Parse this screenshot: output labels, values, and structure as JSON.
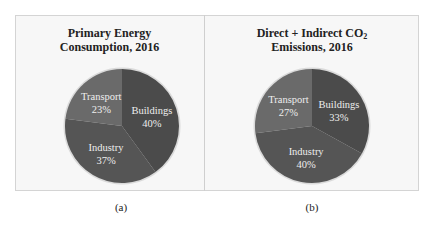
{
  "panels": [
    {
      "id": "a",
      "title_line1": "Primary Energy",
      "title_line2": "Consumption, 2016",
      "caption": "(a)",
      "slices": [
        {
          "label": "Buildings",
          "pct_text": "40%",
          "value": 40,
          "color": "#4b4b4b"
        },
        {
          "label": "Industry",
          "pct_text": "37%",
          "value": 37,
          "color": "#555555"
        },
        {
          "label": "Transport",
          "pct_text": "23%",
          "value": 23,
          "color": "#6a6a6a"
        }
      ]
    },
    {
      "id": "b",
      "title_line1": "Direct + Indirect CO",
      "title_sub": "2",
      "title_line2": "Emissions, 2016",
      "caption": "(b)",
      "slices": [
        {
          "label": "Buildings",
          "pct_text": "33%",
          "value": 33,
          "color": "#4b4b4b"
        },
        {
          "label": "Industry",
          "pct_text": "40%",
          "value": 40,
          "color": "#555555"
        },
        {
          "label": "Transport",
          "pct_text": "27%",
          "value": 27,
          "color": "#6a6a6a"
        }
      ]
    }
  ],
  "chart_data": [
    {
      "type": "pie",
      "title": "Primary Energy Consumption, 2016",
      "categories": [
        "Buildings",
        "Industry",
        "Transport"
      ],
      "values": [
        40,
        37,
        23
      ],
      "unit": "%",
      "caption": "(a)",
      "legend": "none (labels inside slices)"
    },
    {
      "type": "pie",
      "title": "Direct + Indirect CO2 Emissions, 2016",
      "categories": [
        "Buildings",
        "Industry",
        "Transport"
      ],
      "values": [
        33,
        40,
        27
      ],
      "unit": "%",
      "caption": "(b)",
      "legend": "none (labels inside slices)"
    }
  ]
}
